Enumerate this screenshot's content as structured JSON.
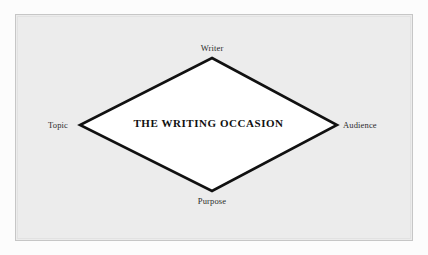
{
  "figure": {
    "name": "the-writing-occasion-diagram",
    "center_label": "THE WRITING OCCASION",
    "vertices": [
      {
        "id": "writer",
        "label": "Writer",
        "position": "top",
        "x": 212,
        "y": 58
      },
      {
        "id": "topic",
        "label": "Topic",
        "position": "left",
        "x": 80,
        "y": 125
      },
      {
        "id": "audience",
        "label": "Audience",
        "position": "right",
        "x": 337,
        "y": 125
      },
      {
        "id": "purpose",
        "label": "Purpose",
        "position": "bottom",
        "x": 212,
        "y": 191
      }
    ],
    "shape": "diamond",
    "colors": {
      "page_background": "#fcfcfc",
      "panel_background": "#ececec",
      "panel_border": "#c6c6c6",
      "diamond_fill": "#ffffff",
      "diamond_stroke": "#111111",
      "text": "#2b2b2b",
      "center_text": "#111111"
    },
    "diamond_stroke_width": 2.6
  }
}
